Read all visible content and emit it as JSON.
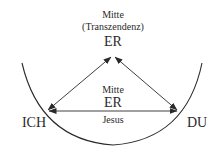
{
  "diagram": {
    "top": {
      "label_line1": "Mitte",
      "label_line2": "(Transzendenz)",
      "node": "ER"
    },
    "center": {
      "label_above": "Mitte",
      "node": "ER",
      "label_below": "Jesus"
    },
    "left_node": "ICH",
    "right_node": "DU",
    "edges": [
      {
        "from": "ICH",
        "to": "ER (top)",
        "type": "bidirectional"
      },
      {
        "from": "DU",
        "to": "ER (top)",
        "type": "bidirectional"
      },
      {
        "from": "ICH",
        "to": "DU",
        "type": "bidirectional"
      }
    ],
    "colors": {
      "stroke": "#2a2a2a",
      "background": "#ffffff"
    }
  }
}
